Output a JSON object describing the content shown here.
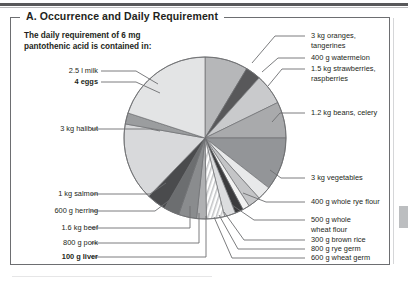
{
  "figure": {
    "panel_title": "A. Occurrence and Daily Requirement",
    "caption_line1": "The daily requirement of 6 mg",
    "caption_line2": "pantothenic acid is contained in:"
  },
  "labels_left": [
    {
      "id": "milk",
      "text": "2.5 l milk",
      "bold": false
    },
    {
      "id": "eggs",
      "text": "4 eggs",
      "bold": true
    },
    {
      "id": "halibut",
      "text": "3 kg halibut",
      "bold": false
    },
    {
      "id": "salmon",
      "text": "1 kg salmon",
      "bold": false
    },
    {
      "id": "herring",
      "text": "600 g herring",
      "bold": false
    },
    {
      "id": "beef",
      "text": "1.6 kg beef",
      "bold": false
    },
    {
      "id": "pork",
      "text": "800 g pork",
      "bold": false
    },
    {
      "id": "liver",
      "text": "100 g liver",
      "bold": true
    }
  ],
  "labels_right": [
    {
      "id": "oranges",
      "line1": "3 kg oranges,",
      "line2": "tangerines"
    },
    {
      "id": "watermelon",
      "line1": "400 g watermelon",
      "line2": ""
    },
    {
      "id": "strawberries",
      "line1": "1.5 kg strawberries,",
      "line2": "raspberries"
    },
    {
      "id": "beans",
      "line1": "1.2 kg beans, celery",
      "line2": ""
    },
    {
      "id": "vegetables",
      "line1": "3 kg vegetables",
      "line2": ""
    },
    {
      "id": "rye-flour",
      "line1": "400 g whole rye flour",
      "line2": ""
    },
    {
      "id": "wheat-flour",
      "line1": "500 g whole",
      "line2": "wheat flour"
    },
    {
      "id": "brown-rice",
      "line1": "300 g brown rice",
      "line2": ""
    },
    {
      "id": "rye-germ",
      "line1": "800 g rye germ",
      "line2": ""
    },
    {
      "id": "wheat-germ",
      "line1": "600 g wheat germ",
      "line2": ""
    }
  ],
  "chart_data": {
    "type": "pie",
    "title": "A. Occurrence and Daily Requirement",
    "subtitle": "The daily requirement of 6 mg pantothenic acid is contained in:",
    "legend": "labelled with leader lines around the pie",
    "note": "Slice angular sizes read off the drawing; values are degrees of the full 360 circle.",
    "center": {
      "x": 205,
      "y": 138
    },
    "radius": 81,
    "start_angle_deg": -90,
    "direction": "clockwise",
    "slices": [
      {
        "label": "3 kg oranges, tangerines",
        "amount": "3 kg",
        "food": "oranges, tangerines",
        "degrees": 31,
        "color": "#b6b7b9"
      },
      {
        "label": "400 g watermelon",
        "amount": "400 g",
        "food": "watermelon",
        "degrees": 11,
        "color": "#58585a"
      },
      {
        "label": "1.5 kg strawberries, raspberries",
        "amount": "1.5 kg",
        "food": "strawberries, raspberries",
        "degrees": 22,
        "color": "#c9cacc"
      },
      {
        "label": "1.2 kg beans, celery",
        "amount": "1.2 kg",
        "food": "beans, celery",
        "degrees": 26,
        "color": "#a9aaac"
      },
      {
        "label": "3 kg vegetables",
        "amount": "3 kg",
        "food": "vegetables",
        "degrees": 38,
        "color": "#939598"
      },
      {
        "label": "400 g whole rye flour",
        "amount": "400 g",
        "food": "whole rye flour",
        "degrees": 10,
        "color": "#e8e9ea"
      },
      {
        "label": "500 g whole wheat flour",
        "amount": "500 g",
        "food": "whole wheat flour",
        "degrees": 9,
        "color": "#c4c5c7"
      },
      {
        "label": "300 g brown rice",
        "amount": "300 g",
        "food": "brown rice",
        "degrees": 5,
        "color": "#f2f2f2"
      },
      {
        "label": "800 g rye germ",
        "amount": "800 g",
        "food": "rye germ",
        "degrees": 6,
        "color": "#3b3b3d"
      },
      {
        "label": "600 g wheat germ",
        "amount": "600 g",
        "food": "wheat germ",
        "degrees": 8,
        "color": "#dcdddf"
      },
      {
        "label": "100 g liver",
        "amount": "100 g",
        "food": "liver",
        "degrees": 13,
        "color": "#ffffff",
        "hatched": true
      },
      {
        "label": "800 g pork",
        "amount": "800 g",
        "food": "pork",
        "degrees": 7,
        "color": "#b0b1b3"
      },
      {
        "label": "1.6 kg beef",
        "amount": "1.6 kg",
        "food": "beef",
        "degrees": 13,
        "color": "#8a8c8e"
      },
      {
        "label": "600 g herring",
        "amount": "600 g",
        "food": "herring",
        "degrees": 11,
        "color": "#6c6e70"
      },
      {
        "label": "1 kg salmon",
        "amount": "1 kg",
        "food": "salmon",
        "degrees": 14,
        "color": "#4a4b4d"
      },
      {
        "label": "3 kg halibut",
        "amount": "3 kg",
        "food": "halibut",
        "degrees": 56,
        "color": "#d8d9db"
      },
      {
        "label": "4 eggs",
        "amount": "4",
        "food": "eggs",
        "degrees": 8,
        "color": "#9b9d9f"
      },
      {
        "label": "2.5 l milk",
        "amount": "2.5 l",
        "food": "milk",
        "degrees": 72,
        "color": "#e3e4e5"
      }
    ]
  }
}
